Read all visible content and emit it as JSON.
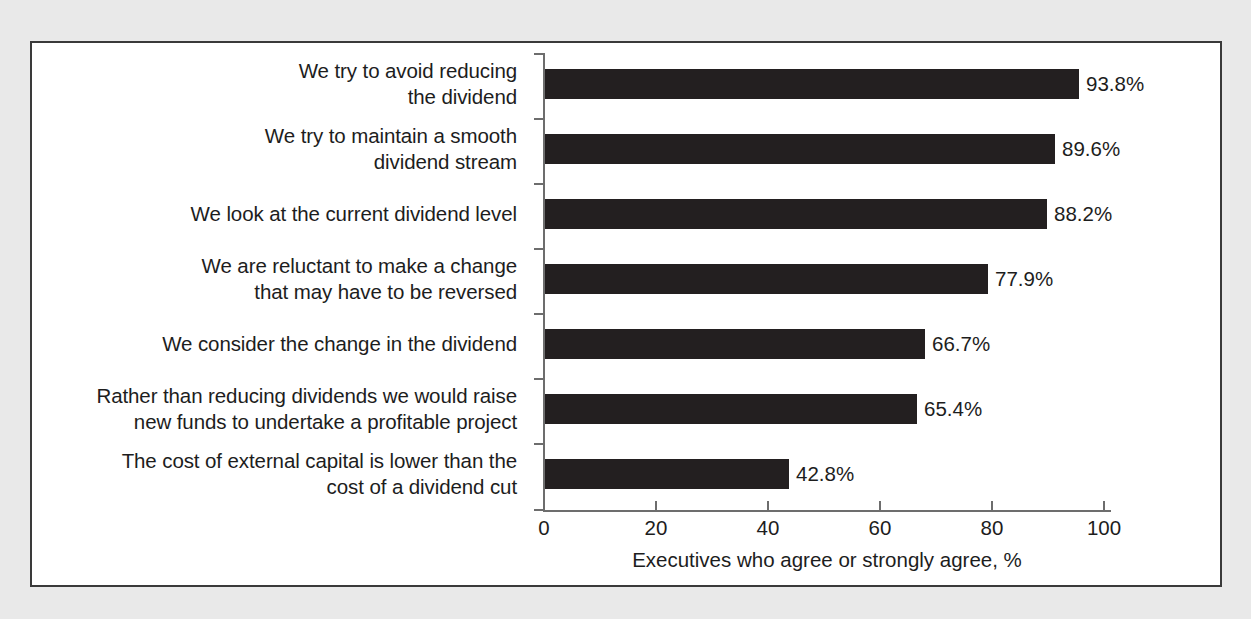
{
  "figure": {
    "background_color": "#e9e9e9",
    "panel_color": "#ffffff",
    "border_color": "#3a3a3a"
  },
  "chart_data": {
    "type": "bar",
    "orientation": "horizontal",
    "title": "",
    "subtitle": "",
    "xlabel": "Executives who agree or strongly agree, %",
    "ylabel": "",
    "xlim": [
      0,
      100
    ],
    "xticks": [
      0,
      20,
      40,
      60,
      80,
      100
    ],
    "xtick_labels": [
      "0",
      "20",
      "40",
      "60",
      "80",
      "100"
    ],
    "grid": false,
    "legend": false,
    "bar_color": "#231f20",
    "categories": [
      "We try to avoid reducing\nthe dividend",
      "We try to maintain a smooth\ndividend stream",
      "We look at the current dividend level",
      "We are reluctant to make a change\nthat may have to be reversed",
      "We consider the change in the dividend",
      "Rather than reducing dividends we would raise\nnew funds to undertake a profitable project",
      "The cost of external capital is lower than the\ncost of a dividend cut"
    ],
    "values": [
      93.8,
      89.6,
      88.2,
      77.9,
      66.7,
      65.4,
      42.8
    ],
    "value_labels": [
      "93.8%",
      "89.6%",
      "88.2%",
      "77.9%",
      "66.7%",
      "65.4%",
      "42.8%"
    ]
  }
}
